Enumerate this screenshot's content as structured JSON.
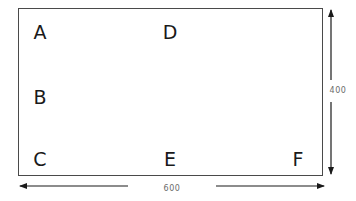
{
  "diagram": {
    "type": "labeled-rectangle-with-dimensions",
    "rectangle": {
      "stroke_color": "#4a4a4a",
      "fill_color": "#ffffff"
    },
    "labels": [
      {
        "id": "A",
        "text": "A",
        "position": "top-left"
      },
      {
        "id": "D",
        "text": "D",
        "position": "top-center"
      },
      {
        "id": "B",
        "text": "B",
        "position": "middle-left"
      },
      {
        "id": "C",
        "text": "C",
        "position": "bottom-left"
      },
      {
        "id": "E",
        "text": "E",
        "position": "bottom-center"
      },
      {
        "id": "F",
        "text": "F",
        "position": "bottom-right"
      }
    ],
    "dimensions": {
      "width": {
        "text": "600",
        "orientation": "horizontal",
        "position": "below"
      },
      "height": {
        "text": "400",
        "orientation": "vertical",
        "position": "right"
      }
    },
    "arrow_color": "#1a1a1a",
    "dimension_text_color": "#6b6b6b"
  }
}
